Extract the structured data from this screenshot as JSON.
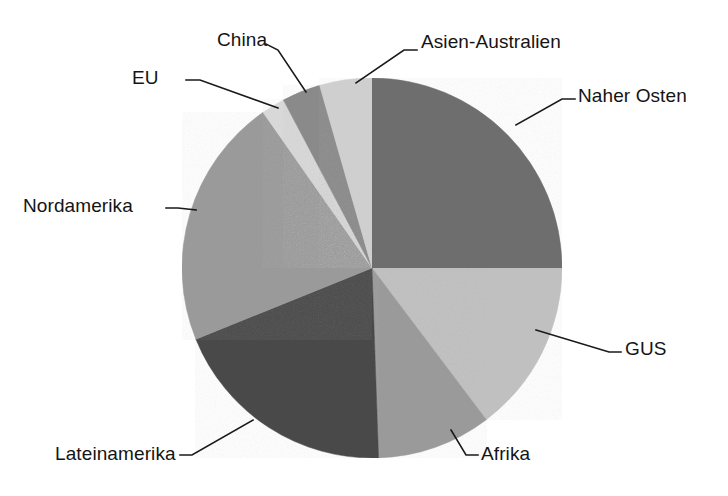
{
  "chart_data": {
    "type": "pie",
    "title": "",
    "subtitle": "",
    "xlabel": "",
    "ylabel": "",
    "legend_position": "none",
    "grid": false,
    "labels_outside": true,
    "leader_lines": true,
    "start_angle_deg": 0,
    "direction": "clockwise",
    "center": {
      "x": 372,
      "y": 268
    },
    "radius": 190,
    "categories": [
      "Naher Osten",
      "GUS",
      "Afrika",
      "Lateinamerika",
      "Nordamerika",
      "EU",
      "China",
      "Asien-Australien"
    ],
    "values": [
      25.0,
      14.7,
      9.7,
      19.4,
      21.4,
      2.0,
      3.3,
      4.5
    ],
    "slices": [
      {
        "label": "Naher Osten",
        "value": 25.0,
        "start_deg": 0,
        "end_deg": 90,
        "color": "#6e6e6e"
      },
      {
        "label": "GUS",
        "value": 14.7,
        "start_deg": 90,
        "end_deg": 143,
        "color": "#c0c0c0"
      },
      {
        "label": "Afrika",
        "value": 9.7,
        "start_deg": 143,
        "end_deg": 178,
        "color": "#9a9a9a"
      },
      {
        "label": "Lateinamerika",
        "value": 19.4,
        "start_deg": 178,
        "end_deg": 248,
        "color": "#4a4a4a"
      },
      {
        "label": "Nordamerika",
        "value": 21.4,
        "start_deg": 248,
        "end_deg": 325,
        "color": "#9a9a9a"
      },
      {
        "label": "EU",
        "value": 2.0,
        "start_deg": 325,
        "end_deg": 332.2,
        "color": "#d8d8d8"
      },
      {
        "label": "China",
        "value": 3.3,
        "start_deg": 332.2,
        "end_deg": 344.0,
        "color": "#8a8a8a"
      },
      {
        "label": "Asien-Australien",
        "value": 4.5,
        "start_deg": 344.0,
        "end_deg": 360,
        "color": "#cfcfcf"
      }
    ]
  },
  "labels": {
    "asien_australien": "Asien-Australien",
    "naher_osten": "Naher Osten",
    "gus": "GUS",
    "afrika": "Afrika",
    "lateinamerika": "Lateinamerika",
    "nordamerika": "Nordamerika",
    "eu": "EU",
    "china": "China"
  },
  "colors": {
    "background": "#ffffff",
    "text": "#141414",
    "leader_line": "#1a1a1a",
    "slice_naher_osten": "#6e6e6e",
    "slice_gus": "#c0c0c0",
    "slice_afrika": "#9a9a9a",
    "slice_lateinamerika": "#4a4a4a",
    "slice_nordamerika": "#9a9a9a",
    "slice_eu": "#d8d8d8",
    "slice_china": "#8a8a8a",
    "slice_asien_australien": "#cfcfcf"
  }
}
